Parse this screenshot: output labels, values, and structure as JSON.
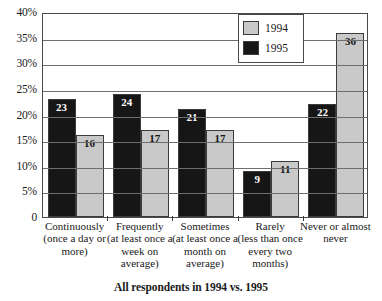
{
  "chart_data": {
    "type": "bar",
    "title": "",
    "subtitle": "",
    "caption": "All respondents in 1994 vs. 1995",
    "xlabel": "",
    "ylabel": "",
    "ylim": [
      0,
      40
    ],
    "grid": true,
    "legend_position": "top-right",
    "ytick_labels": [
      "0",
      "5%",
      "10%",
      "15%",
      "20%",
      "25%",
      "30%",
      "35%",
      "40%"
    ],
    "ytick_values": [
      0,
      5,
      10,
      15,
      20,
      25,
      30,
      35,
      40
    ],
    "categories": [
      {
        "main": "Continuously",
        "sub": "(once a day or more)"
      },
      {
        "main": "Frequently",
        "sub": "(at least once a week on average)"
      },
      {
        "main": "Sometimes",
        "sub": "(at least once a month on average)"
      },
      {
        "main": "Rarely",
        "sub": "(less than once every two months)"
      },
      {
        "main": "Never or almost never",
        "sub": ""
      }
    ],
    "series": [
      {
        "name": "1995",
        "color": "#161616",
        "values": [
          23,
          24,
          21,
          9,
          22
        ]
      },
      {
        "name": "1994",
        "color": "#c9c9c9",
        "values": [
          16,
          17,
          17,
          11,
          36
        ]
      }
    ],
    "series_order_in_group": [
      "1995",
      "1994"
    ]
  },
  "legend": {
    "entries": [
      {
        "label": "1994",
        "swatch": "s1994"
      },
      {
        "label": "1995",
        "swatch": "s1995"
      }
    ]
  }
}
